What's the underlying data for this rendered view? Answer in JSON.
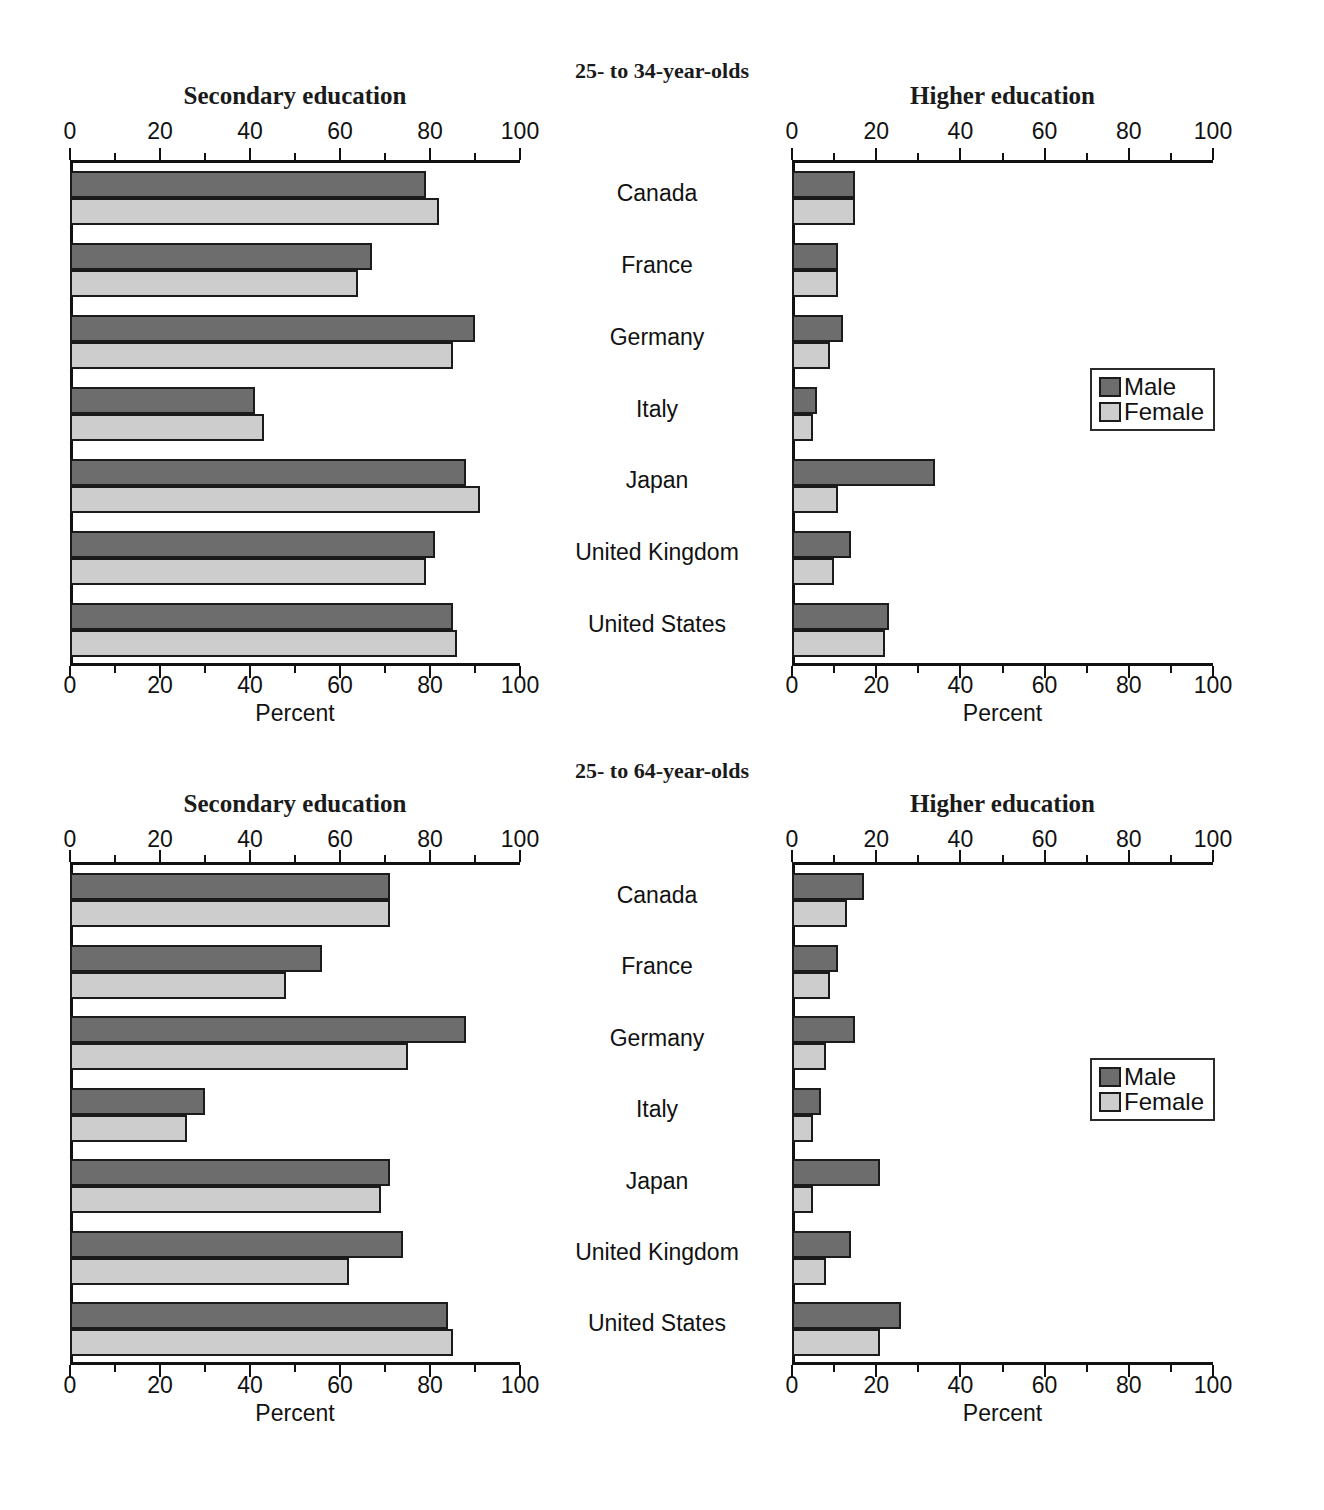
{
  "figure": {
    "title": "",
    "legend": {
      "entries": [
        {
          "label": "Male",
          "color": "#6d6d6d"
        },
        {
          "label": "Female",
          "color": "#cdcdcd"
        }
      ]
    },
    "axis_label": "Percent",
    "tick_labels": [
      "0",
      "20",
      "40",
      "60",
      "80",
      "100"
    ],
    "categories": [
      "Canada",
      "France",
      "Germany",
      "Italy",
      "Japan",
      "United Kingdom",
      "United States"
    ],
    "age_groups": [
      {
        "id": "25-34",
        "label": "25- to 34-year-olds"
      },
      {
        "id": "25-64",
        "label": "25- to 64-year-olds"
      }
    ],
    "panel_titles": {
      "secondary": "Secondary education",
      "higher": "Higher education"
    }
  },
  "chart_data": [
    {
      "type": "bar",
      "orientation": "horizontal",
      "title": "Secondary education",
      "subtitle": "25- to 34-year-olds",
      "xlabel": "Percent",
      "ylabel": "",
      "xlim": [
        0,
        100
      ],
      "xticks": [
        0,
        20,
        40,
        60,
        80,
        100
      ],
      "grid": false,
      "legend": "none",
      "categories": [
        "Canada",
        "France",
        "Germany",
        "Italy",
        "Japan",
        "United Kingdom",
        "United States"
      ],
      "series": [
        {
          "name": "Male",
          "color": "#6d6d6d",
          "values": [
            79,
            67,
            90,
            41,
            88,
            81,
            85
          ]
        },
        {
          "name": "Female",
          "color": "#cdcdcd",
          "values": [
            82,
            64,
            85,
            43,
            91,
            79,
            86
          ]
        }
      ]
    },
    {
      "type": "bar",
      "orientation": "horizontal",
      "title": "Higher education",
      "subtitle": "25- to 34-year-olds",
      "xlabel": "Percent",
      "ylabel": "",
      "xlim": [
        0,
        100
      ],
      "xticks": [
        0,
        20,
        40,
        60,
        80,
        100
      ],
      "grid": false,
      "legend": "right",
      "categories": [
        "Canada",
        "France",
        "Germany",
        "Italy",
        "Japan",
        "United Kingdom",
        "United States"
      ],
      "series": [
        {
          "name": "Male",
          "color": "#6d6d6d",
          "values": [
            15,
            11,
            12,
            6,
            34,
            14,
            23
          ]
        },
        {
          "name": "Female",
          "color": "#cdcdcd",
          "values": [
            15,
            11,
            9,
            5,
            11,
            10,
            22
          ]
        }
      ]
    },
    {
      "type": "bar",
      "orientation": "horizontal",
      "title": "Secondary education",
      "subtitle": "25- to 64-year-olds",
      "xlabel": "Percent",
      "ylabel": "",
      "xlim": [
        0,
        100
      ],
      "xticks": [
        0,
        20,
        40,
        60,
        80,
        100
      ],
      "grid": false,
      "legend": "none",
      "categories": [
        "Canada",
        "France",
        "Germany",
        "Italy",
        "Japan",
        "United Kingdom",
        "United States"
      ],
      "series": [
        {
          "name": "Male",
          "color": "#6d6d6d",
          "values": [
            71,
            56,
            88,
            30,
            71,
            74,
            84
          ]
        },
        {
          "name": "Female",
          "color": "#cdcdcd",
          "values": [
            71,
            48,
            75,
            26,
            69,
            62,
            85
          ]
        }
      ]
    },
    {
      "type": "bar",
      "orientation": "horizontal",
      "title": "Higher education",
      "subtitle": "25- to 64-year-olds",
      "xlabel": "Percent",
      "ylabel": "",
      "xlim": [
        0,
        100
      ],
      "xticks": [
        0,
        20,
        40,
        60,
        80,
        100
      ],
      "grid": false,
      "legend": "right",
      "categories": [
        "Canada",
        "France",
        "Germany",
        "Italy",
        "Japan",
        "United Kingdom",
        "United States"
      ],
      "series": [
        {
          "name": "Male",
          "color": "#6d6d6d",
          "values": [
            17,
            11,
            15,
            7,
            21,
            14,
            26
          ]
        },
        {
          "name": "Female",
          "color": "#cdcdcd",
          "values": [
            13,
            9,
            8,
            5,
            5,
            8,
            21
          ]
        }
      ]
    }
  ]
}
